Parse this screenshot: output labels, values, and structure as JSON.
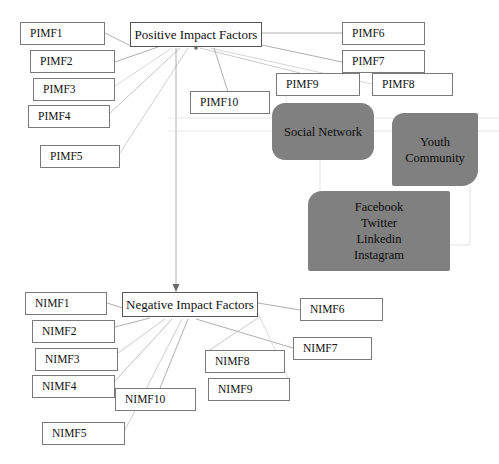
{
  "diagram": {
    "title_fragment": "",
    "center_nodes": {
      "positive": "Positive Impact Factors",
      "negative": "Negative Impact Factors"
    },
    "positive_factors": [
      {
        "id": "pimf1",
        "label": "PIMF1"
      },
      {
        "id": "pimf2",
        "label": "PIMF2"
      },
      {
        "id": "pimf3",
        "label": "PIMF3"
      },
      {
        "id": "pimf4",
        "label": "PIMF4"
      },
      {
        "id": "pimf5",
        "label": "PIMF5"
      },
      {
        "id": "pimf6",
        "label": "PIMF6"
      },
      {
        "id": "pimf7",
        "label": "PIMF7"
      },
      {
        "id": "pimf8",
        "label": "PIMF8"
      },
      {
        "id": "pimf9",
        "label": "PIMF9"
      },
      {
        "id": "pimf10",
        "label": "PIMF10"
      }
    ],
    "negative_factors": [
      {
        "id": "nimf1",
        "label": "NIMF1"
      },
      {
        "id": "nimf2",
        "label": "NIMF2"
      },
      {
        "id": "nimf3",
        "label": "NIMF3"
      },
      {
        "id": "nimf4",
        "label": "NIMF4"
      },
      {
        "id": "nimf5",
        "label": "NIMF5"
      },
      {
        "id": "nimf6",
        "label": "NIMF6"
      },
      {
        "id": "nimf7",
        "label": "NIMF7"
      },
      {
        "id": "nimf8",
        "label": "NIMF8"
      },
      {
        "id": "nimf9",
        "label": "NIMF9"
      },
      {
        "id": "nimf10",
        "label": "NIMF10"
      }
    ],
    "entities": {
      "social_network": "Social Network",
      "youth_community_line1": "Youth",
      "youth_community_line2": "Community",
      "platforms": [
        "Facebook",
        "Twitter",
        "Linkedin",
        "Instagram"
      ]
    },
    "colors": {
      "shape_fill": "#808080",
      "box_border": "#7a7a7a",
      "edge": "#9a9a9a",
      "text": "#111111",
      "background": "#ffffff"
    }
  }
}
